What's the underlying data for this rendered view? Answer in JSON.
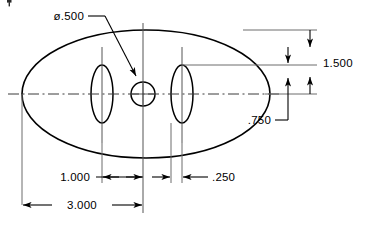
{
  "drawing": {
    "title": "Elliptical plate with center hole and two slots",
    "units": "inch",
    "line_color": "#000000",
    "centerline_color": "#3a3a3a",
    "background": "#ffffff",
    "dimensions": [
      {
        "id": "hole-diameter",
        "label": "ø.500",
        "type": "leader",
        "value": 0.5,
        "feature": "center-hole"
      },
      {
        "id": "vertical-overall",
        "label": "1.500",
        "type": "linear-vertical",
        "value": 1.5,
        "feature": "slot-top-to-centerline"
      },
      {
        "id": "slot-offset-vertical",
        "label": ".750",
        "type": "leader",
        "value": 0.75,
        "feature": "centerline-to-slot"
      },
      {
        "id": "left-slot-to-center",
        "label": "1.000",
        "type": "linear-horizontal",
        "value": 1.0,
        "feature": "left-slot-center-to-hole-center"
      },
      {
        "id": "right-slot-width",
        "label": ".250",
        "type": "linear-horizontal",
        "value": 0.25,
        "feature": "right-slot-width"
      },
      {
        "id": "overall-length",
        "label": "3.000",
        "type": "linear-horizontal",
        "value": 3.0,
        "feature": "ellipse-left-vertex-to-hole-center"
      }
    ],
    "features": [
      {
        "id": "outer-ellipse",
        "name": "outer-ellipse-profile"
      },
      {
        "id": "left-slot",
        "name": "left-slot-ellipse"
      },
      {
        "id": "right-slot",
        "name": "right-slot-ellipse"
      },
      {
        "id": "center-hole",
        "name": "center-hole-circle"
      }
    ]
  }
}
